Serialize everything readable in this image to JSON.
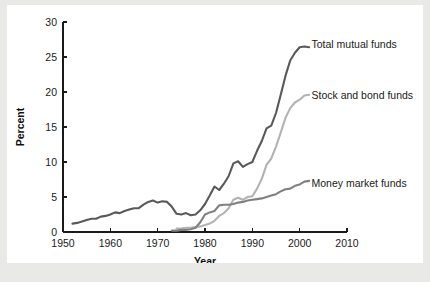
{
  "figure": {
    "background_color": "#e9e9e7",
    "card_color": "#ffffff"
  },
  "chart_data": {
    "type": "line",
    "title": "",
    "xlabel": "Year",
    "ylabel": "Percent",
    "xlim": [
      1950,
      2010
    ],
    "ylim": [
      0,
      30
    ],
    "xticks": [
      1950,
      1960,
      1970,
      1980,
      1990,
      2000,
      2010
    ],
    "xtick_labels": [
      "1950",
      "1960",
      "1970",
      "1980",
      "1990",
      "2000",
      "2010"
    ],
    "yticks": [
      0,
      5,
      10,
      15,
      20,
      25,
      30
    ],
    "ytick_labels": [
      "0",
      "5",
      "10",
      "15",
      "20",
      "25",
      "30"
    ],
    "grid": false,
    "legend_position": "inline-right-of-line-ends",
    "series": [
      {
        "name": "Total mutual funds",
        "color": "#595959",
        "label_x": 2002.5,
        "label_y": 26.8,
        "x": [
          1952,
          1953,
          1954,
          1955,
          1956,
          1957,
          1958,
          1959,
          1960,
          1961,
          1962,
          1963,
          1964,
          1965,
          1966,
          1967,
          1968,
          1969,
          1970,
          1971,
          1972,
          1973,
          1974,
          1975,
          1976,
          1977,
          1978,
          1979,
          1980,
          1981,
          1982,
          1983,
          1984,
          1985,
          1986,
          1987,
          1988,
          1989,
          1990,
          1991,
          1992,
          1993,
          1994,
          1995,
          1996,
          1997,
          1998,
          1999,
          2000,
          2001,
          2002
        ],
        "values": [
          1.2,
          1.3,
          1.5,
          1.7,
          1.9,
          1.9,
          2.2,
          2.3,
          2.5,
          2.8,
          2.7,
          3.0,
          3.2,
          3.4,
          3.4,
          3.9,
          4.3,
          4.5,
          4.2,
          4.4,
          4.3,
          3.6,
          2.6,
          2.5,
          2.7,
          2.4,
          2.5,
          3.1,
          4.0,
          5.2,
          6.5,
          6.0,
          6.9,
          8.0,
          9.8,
          10.1,
          9.3,
          9.7,
          10.0,
          11.6,
          13.0,
          14.8,
          15.2,
          17.0,
          19.6,
          22.3,
          24.5,
          25.6,
          26.4,
          26.5,
          26.4
        ]
      },
      {
        "name": "Stock and bond funds",
        "color": "#b3b3b3",
        "label_x": 2002.5,
        "label_y": 19.6,
        "x": [
          1974,
          1975,
          1976,
          1977,
          1978,
          1979,
          1980,
          1981,
          1982,
          1983,
          1984,
          1985,
          1986,
          1987,
          1988,
          1989,
          1990,
          1991,
          1992,
          1993,
          1994,
          1995,
          1996,
          1997,
          1998,
          1999,
          2000,
          2001,
          2002
        ],
        "values": [
          0.5,
          0.5,
          0.6,
          0.6,
          0.7,
          0.8,
          1.0,
          1.2,
          1.6,
          2.3,
          2.7,
          3.4,
          4.6,
          4.9,
          4.6,
          5.0,
          5.1,
          6.2,
          7.6,
          9.6,
          10.5,
          12.2,
          14.2,
          16.3,
          17.7,
          18.5,
          18.9,
          19.5,
          19.6
        ]
      },
      {
        "name": "Money market funds",
        "color": "#808080",
        "label_x": 2002.5,
        "label_y": 6.9,
        "x": [
          1973,
          1974,
          1975,
          1976,
          1977,
          1978,
          1979,
          1980,
          1981,
          1982,
          1983,
          1984,
          1985,
          1986,
          1987,
          1988,
          1989,
          1990,
          1991,
          1992,
          1993,
          1994,
          1995,
          1996,
          1997,
          1998,
          1999,
          2000,
          2001,
          2002
        ],
        "values": [
          0.2,
          0.2,
          0.3,
          0.3,
          0.4,
          0.6,
          1.4,
          2.5,
          2.8,
          3.0,
          3.8,
          3.9,
          3.9,
          4.0,
          4.2,
          4.3,
          4.5,
          4.6,
          4.7,
          4.8,
          5.0,
          5.2,
          5.4,
          5.8,
          6.1,
          6.2,
          6.6,
          6.8,
          7.2,
          7.3
        ]
      }
    ]
  }
}
